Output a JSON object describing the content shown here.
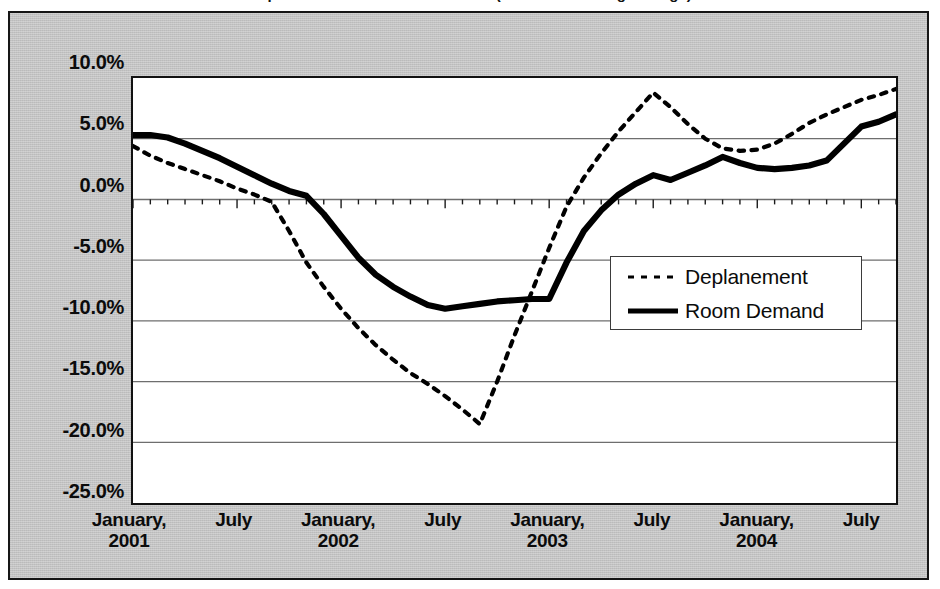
{
  "title_partial": "Deplanements and Room Demand (12-month moving average)",
  "y_axis": {
    "labels": [
      "10.0%",
      "5.0%",
      "0.0%",
      "-5.0%",
      "-10.0%",
      "-15.0%",
      "-20.0%",
      "-25.0%"
    ]
  },
  "x_axis": {
    "labels": [
      "January,\n2001",
      "July",
      "January,\n2002",
      "July",
      "January,\n2003",
      "July",
      "January,\n2004",
      "July"
    ]
  },
  "legend": {
    "items": [
      {
        "label": "Deplanement",
        "style": "dotted",
        "color": "#000000"
      },
      {
        "label": "Room Demand",
        "style": "solid",
        "color": "#000000"
      }
    ]
  },
  "colors": {
    "frame_background": "#c3c3c3",
    "plot_background": "#ffffff",
    "border": "#161616",
    "gridline": "#6e6e6e",
    "series": "#000000"
  },
  "chart_data": {
    "type": "line",
    "title": "Deplanements and Room Demand (12-month moving average)",
    "xlabel": "",
    "ylabel": "",
    "ylim": [
      -25.0,
      10.0
    ],
    "ytick_values": [
      10.0,
      5.0,
      0.0,
      -5.0,
      -10.0,
      -15.0,
      -20.0,
      -25.0
    ],
    "grid": true,
    "legend_position": "center-right",
    "x_tick_labels": [
      "January, 2001",
      "July",
      "January, 2002",
      "July",
      "January, 2003",
      "July",
      "January, 2004",
      "July"
    ],
    "x_major_ticks_index": [
      0,
      6,
      12,
      18,
      24,
      30,
      36,
      42
    ],
    "x": [
      "2001-01",
      "2001-02",
      "2001-03",
      "2001-04",
      "2001-05",
      "2001-06",
      "2001-07",
      "2001-08",
      "2001-09",
      "2001-10",
      "2001-11",
      "2001-12",
      "2002-01",
      "2002-02",
      "2002-03",
      "2002-04",
      "2002-05",
      "2002-06",
      "2002-07",
      "2002-08",
      "2002-09",
      "2002-10",
      "2002-11",
      "2002-12",
      "2003-01",
      "2003-02",
      "2003-03",
      "2003-04",
      "2003-05",
      "2003-06",
      "2003-07",
      "2003-08",
      "2003-09",
      "2003-10",
      "2003-11",
      "2003-12",
      "2004-01",
      "2004-02",
      "2004-03",
      "2004-04",
      "2004-05",
      "2004-06",
      "2004-07",
      "2004-08",
      "2004-09"
    ],
    "series": [
      {
        "name": "Deplanement",
        "style": "dotted",
        "values": [
          4.4,
          3.6,
          3.0,
          2.5,
          2.0,
          1.5,
          0.9,
          0.4,
          -0.2,
          -2.6,
          -5.2,
          -7.2,
          -9.0,
          -10.6,
          -12.0,
          -13.2,
          -14.3,
          -15.2,
          -16.2,
          -17.3,
          -18.5,
          -15.0,
          -11.2,
          -7.6,
          -4.0,
          -0.6,
          1.8,
          3.8,
          5.6,
          7.2,
          8.8,
          7.6,
          6.2,
          5.0,
          4.2,
          4.0,
          4.1,
          4.6,
          5.4,
          6.3,
          7.0,
          7.6,
          8.2,
          8.6,
          9.1
        ]
      },
      {
        "name": "Room Demand",
        "style": "solid",
        "values": [
          5.3,
          5.3,
          5.1,
          4.6,
          4.0,
          3.4,
          2.7,
          2.0,
          1.3,
          0.7,
          0.3,
          -1.2,
          -3.0,
          -4.8,
          -6.2,
          -7.2,
          -8.0,
          -8.7,
          -9.0,
          -8.8,
          -8.6,
          -8.4,
          -8.3,
          -8.2,
          -8.2,
          -5.2,
          -2.6,
          -0.9,
          0.4,
          1.3,
          2.0,
          1.6,
          2.2,
          2.8,
          3.5,
          3.0,
          2.6,
          2.5,
          2.6,
          2.8,
          3.2,
          4.6,
          6.0,
          6.4,
          7.0
        ]
      }
    ]
  }
}
